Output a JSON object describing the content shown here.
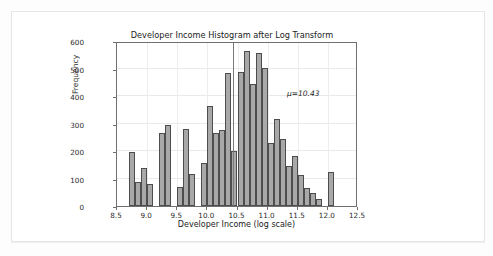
{
  "notebook": {
    "out_prompt": "Out"
  },
  "chart_data": {
    "type": "bar",
    "title": "Developer Income Histogram after Log Transform",
    "xlabel": "Developer Income (log scale)",
    "ylabel": "Frequency",
    "xlim": [
      8.5,
      12.5
    ],
    "ylim": [
      0,
      600
    ],
    "xticks": [
      "8.5",
      "9.0",
      "9.5",
      "10.0",
      "10.5",
      "11.0",
      "11.5",
      "12.0",
      "12.5"
    ],
    "xtick_values": [
      8.5,
      9.0,
      9.5,
      10.0,
      10.5,
      11.0,
      11.5,
      12.0,
      12.5
    ],
    "yticks": [
      "0",
      "100",
      "200",
      "300",
      "400",
      "500",
      "600"
    ],
    "ytick_values": [
      0,
      100,
      200,
      300,
      400,
      500,
      600
    ],
    "grid": true,
    "legend": null,
    "bin_width": 0.1,
    "bin_left_edges": [
      8.7,
      8.8,
      8.9,
      9.0,
      9.1,
      9.2,
      9.3,
      9.4,
      9.5,
      9.6,
      9.7,
      9.8,
      9.9,
      10.0,
      10.1,
      10.2,
      10.3,
      10.4,
      10.5,
      10.6,
      10.7,
      10.8,
      10.9,
      11.0,
      11.1,
      11.2,
      11.3,
      11.4,
      11.5,
      11.6,
      11.7,
      11.8,
      11.9,
      12.0,
      12.1
    ],
    "values": [
      196,
      88,
      138,
      80,
      0,
      266,
      293,
      0,
      70,
      279,
      116,
      0,
      155,
      362,
      265,
      277,
      485,
      200,
      487,
      565,
      444,
      558,
      501,
      228,
      318,
      243,
      146,
      183,
      113,
      66,
      49,
      27,
      0,
      124,
      0
    ],
    "categories": [
      "8.7",
      "8.8",
      "8.9",
      "9.0",
      "9.1",
      "9.2",
      "9.3",
      "9.4",
      "9.5",
      "9.6",
      "9.7",
      "9.8",
      "9.9",
      "10.0",
      "10.1",
      "10.2",
      "10.3",
      "10.4",
      "10.5",
      "10.6",
      "10.7",
      "10.8",
      "10.9",
      "11.0",
      "11.1",
      "11.2",
      "11.3",
      "11.4",
      "11.5",
      "11.6",
      "11.7",
      "11.8",
      "11.9",
      "12.0",
      "12.1"
    ],
    "annotations": [
      {
        "text": "μ=10.43",
        "x": 11.15,
        "y": 430
      }
    ],
    "vlines": [
      {
        "x": 10.43,
        "label": "mean",
        "color": "#7a7a7a"
      }
    ],
    "bar_color": "#a8a8a8",
    "bar_edge_color": "#4d4d4d"
  }
}
